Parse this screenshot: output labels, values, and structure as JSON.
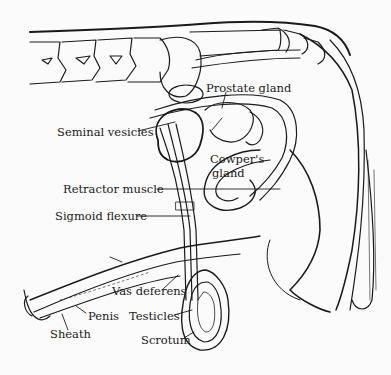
{
  "diagram": {
    "type": "anatomical-line-drawing",
    "colors": {
      "ink": "#1a1a1a",
      "paper": "#fbfbfb"
    },
    "labels": {
      "prostate_gland": "Prostate gland",
      "seminal_vesicles": "Seminal vesicles",
      "cowpers_gland_line1": "Cowper's",
      "cowpers_gland_line2": "gland",
      "retractor_muscle": "Retractor muscle",
      "sigmoid_flexure": "Sigmoid flexure",
      "vas_deferens": "Vas deferens",
      "penis": "Penis",
      "testicles": "Testicles",
      "sheath": "Sheath",
      "scrotum": "Scrotum"
    }
  }
}
